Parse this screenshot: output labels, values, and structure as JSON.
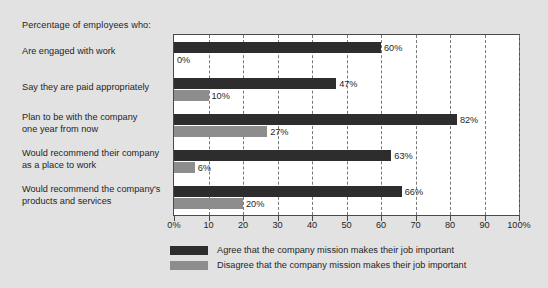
{
  "chart_data": {
    "type": "bar",
    "orientation": "horizontal",
    "title": "Percentage of employees who:",
    "xlabel": "",
    "ylabel": "",
    "xlim": [
      0,
      100
    ],
    "grid": true,
    "legend_position": "bottom",
    "categories": [
      "Are engaged with work",
      "Say they are paid appropriately",
      "Plan to be with the company\none year from now",
      "Would recommend their company\nas a place to work",
      "Would recommend the company's\nproducts and services"
    ],
    "series": [
      {
        "name": "Agree that the company mission makes their job important",
        "color": "#2d2d2d",
        "values": [
          60,
          47,
          82,
          63,
          66
        ],
        "labels": [
          "60%",
          "47%",
          "82%",
          "63%",
          "66%"
        ]
      },
      {
        "name": "Disagree that the company mission makes their job important",
        "color": "#8d8d8d",
        "values": [
          0,
          10,
          27,
          6,
          20
        ],
        "labels": [
          "0%",
          "10%",
          "27%",
          "6%",
          "20%"
        ]
      }
    ],
    "xticks": [
      0,
      10,
      20,
      30,
      40,
      50,
      60,
      70,
      80,
      90,
      100
    ],
    "xtick_labels": [
      "0%",
      "10",
      "20",
      "30",
      "40",
      "50",
      "60",
      "70",
      "80",
      "90",
      "100%"
    ]
  },
  "categories_display": [
    {
      "line1": "Are engaged with work",
      "line2": ""
    },
    {
      "line1": "Say they are paid appropriately",
      "line2": ""
    },
    {
      "line1": "Plan to be with the company",
      "line2": "one year from now"
    },
    {
      "line1": "Would recommend their company",
      "line2": "as a place to work"
    },
    {
      "line1": "Would recommend the company's",
      "line2": "products and services"
    }
  ],
  "legend": {
    "items": [
      {
        "label": "Agree that the company mission makes their job important",
        "color": "#2d2d2d"
      },
      {
        "label": "Disagree that the company mission makes their job important",
        "color": "#8d8d8d"
      }
    ]
  },
  "colors": {
    "background": "#e2e2e2",
    "plot_background": "#ffffff",
    "axis": "#4a4a4a",
    "gridline": "#777777",
    "agree": "#2d2d2d",
    "disagree": "#8d8d8d",
    "text": "#1f1f1f"
  }
}
